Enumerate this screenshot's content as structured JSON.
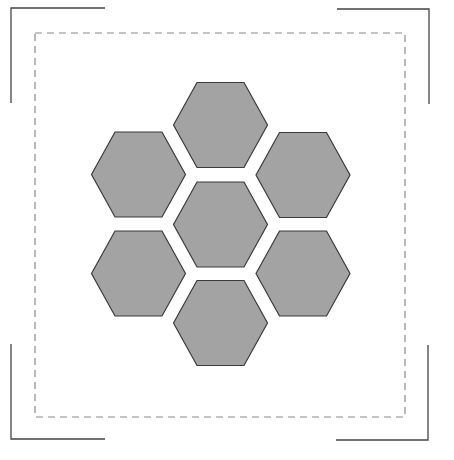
{
  "canvas": {
    "width": 454,
    "height": 460,
    "background": "#ffffff"
  },
  "colors": {
    "hex_fill": "#a3a3a3",
    "hex_stroke": "#3a3a3a",
    "corner_stroke": "#444444",
    "dash_stroke": "#8a8a8a"
  },
  "corner_marks": [
    {
      "name": "top-left",
      "points": "105,8 11,8 11,103"
    },
    {
      "name": "top-right",
      "points": "337,9 429,9 429,104"
    },
    {
      "name": "bottom-left",
      "points": "11,344 11,439 105,439"
    },
    {
      "name": "bottom-right",
      "points": "428,345 428,440 336,440"
    }
  ],
  "dashed_frame": {
    "x": 35,
    "y": 33,
    "width": 370,
    "height": 384,
    "dash": "7 5"
  },
  "hexagons": [
    {
      "name": "top",
      "cx": 220.5,
      "cy": 125,
      "r": 47,
      "h": 42.5
    },
    {
      "name": "upper-left",
      "cx": 138.5,
      "cy": 174.5,
      "r": 47,
      "h": 42.5
    },
    {
      "name": "upper-right",
      "cx": 303,
      "cy": 175,
      "r": 47,
      "h": 42.5
    },
    {
      "name": "center",
      "cx": 220.5,
      "cy": 224.5,
      "r": 47,
      "h": 42.5
    },
    {
      "name": "lower-left",
      "cx": 138.5,
      "cy": 273.5,
      "r": 47,
      "h": 42.5
    },
    {
      "name": "lower-right",
      "cx": 303,
      "cy": 273.5,
      "r": 47,
      "h": 42.5
    },
    {
      "name": "bottom",
      "cx": 220.5,
      "cy": 323,
      "r": 47,
      "h": 42.5
    }
  ]
}
